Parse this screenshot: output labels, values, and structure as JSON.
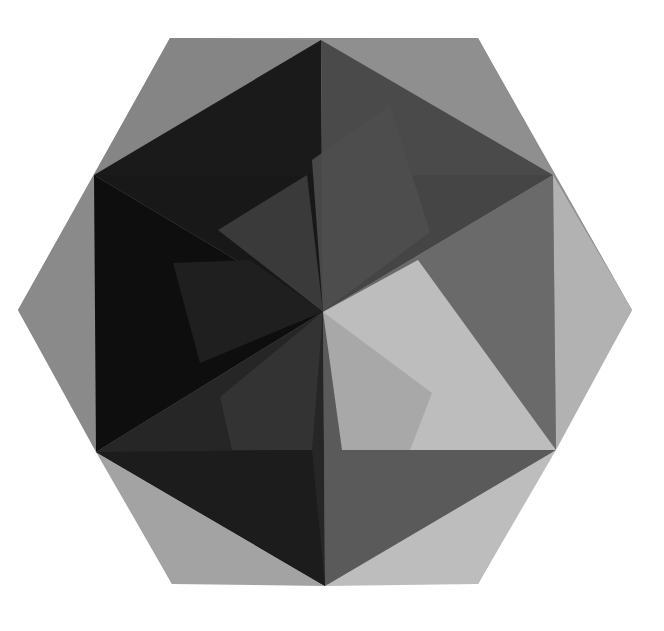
{
  "artwork": {
    "title": "Geometric hexagon composition",
    "palette": {
      "background": "#ffffff",
      "hexagon_base": "#8e8e8e",
      "darkest": "#0e0e0e",
      "dark": "#1e1e1e",
      "mid_dark": "#3a3a3a",
      "mid": "#5e5e5e",
      "light": "#a9a9a9",
      "lightest": "#c8c8c8"
    }
  }
}
